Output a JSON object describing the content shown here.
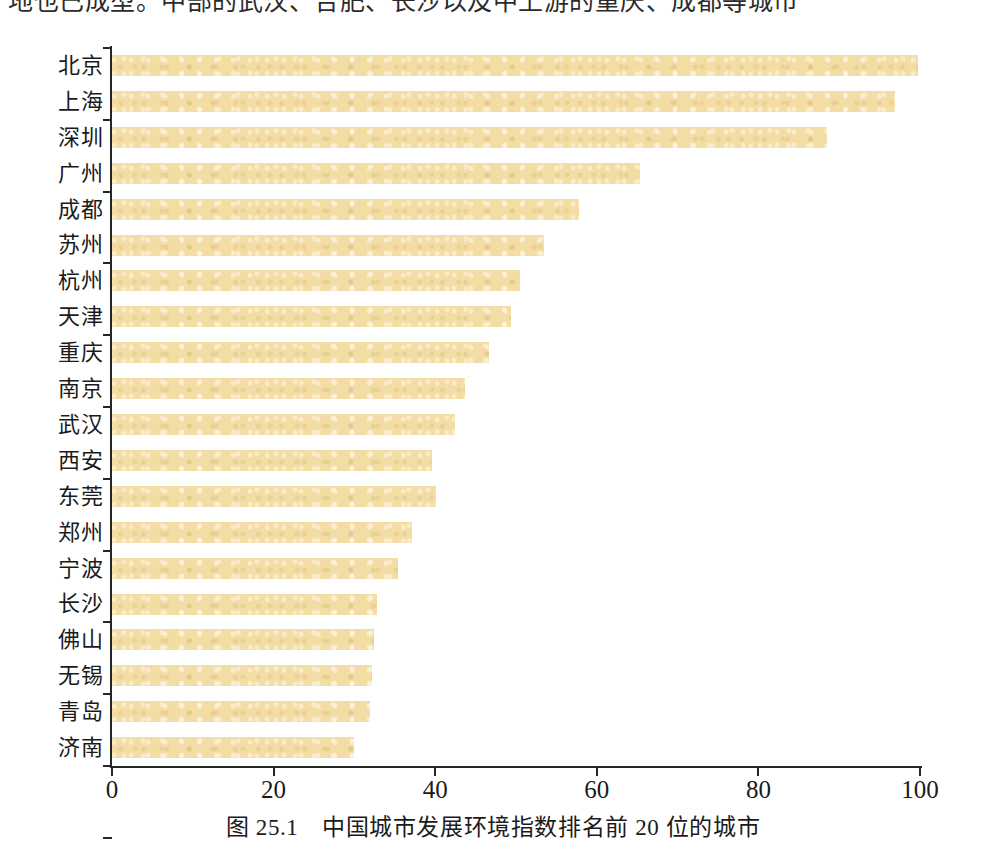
{
  "page": {
    "cropped_text_above": "地也已成型。中部的武汉、合肥、长沙以及中上游的重庆、成都等城市"
  },
  "figure": {
    "caption_number": "图 25.1",
    "caption_text": "中国城市发展环境指数排名前 20 位的城市",
    "caption_full": "图 25.1　中国城市发展环境指数排名前 20 位的城市",
    "bar_color": "#f4dda4",
    "axis_color": "#262626"
  },
  "chart_data": {
    "type": "bar",
    "orientation": "horizontal",
    "title": "中国城市发展环境指数排名前 20 位的城市",
    "xlabel": "",
    "ylabel": "",
    "xlim": [
      0,
      100
    ],
    "xticks": [
      0,
      20,
      40,
      60,
      80,
      100
    ],
    "xtick_labels": [
      "0",
      "20",
      "40",
      "60",
      "80",
      "100"
    ],
    "grid": false,
    "legend": false,
    "categories": [
      "北京",
      "上海",
      "深圳",
      "广州",
      "成都",
      "苏州",
      "杭州",
      "天津",
      "重庆",
      "南京",
      "武汉",
      "西安",
      "东莞",
      "郑州",
      "宁波",
      "长沙",
      "佛山",
      "无锡",
      "青岛",
      "济南"
    ],
    "values": [
      99.8,
      96.9,
      88.5,
      65.3,
      57.8,
      53.5,
      50.5,
      49.4,
      46.6,
      43.7,
      42.4,
      39.6,
      40.1,
      37.1,
      35.4,
      32.8,
      32.4,
      32.2,
      31.9,
      30.0
    ],
    "series": [
      {
        "name": "城市发展环境指数",
        "values": [
          99.8,
          96.9,
          88.5,
          65.3,
          57.8,
          53.5,
          50.5,
          49.4,
          46.6,
          43.7,
          42.4,
          39.6,
          40.1,
          37.1,
          35.4,
          32.8,
          32.4,
          32.2,
          31.9,
          30.0
        ]
      }
    ]
  }
}
